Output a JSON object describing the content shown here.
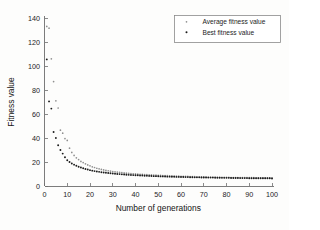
{
  "chart_data": {
    "type": "scatter",
    "title": "",
    "xlabel": "Number of generations",
    "ylabel": "Fitness value",
    "xlim": [
      0,
      100
    ],
    "ylim": [
      0,
      140
    ],
    "xticks": [
      0,
      10,
      20,
      30,
      40,
      50,
      60,
      70,
      80,
      90,
      100
    ],
    "yticks": [
      0,
      20,
      40,
      60,
      80,
      100,
      120,
      140
    ],
    "grid": false,
    "legend_position": "upper right",
    "legend": [
      "Average fitness value",
      "Best fitness value"
    ],
    "x": [
      1,
      2,
      3,
      4,
      5,
      6,
      7,
      8,
      9,
      10,
      11,
      12,
      13,
      14,
      15,
      16,
      17,
      18,
      19,
      20,
      21,
      22,
      23,
      24,
      25,
      26,
      27,
      28,
      29,
      30,
      31,
      32,
      33,
      34,
      35,
      36,
      37,
      38,
      39,
      40,
      41,
      42,
      43,
      44,
      45,
      46,
      47,
      48,
      49,
      50,
      51,
      52,
      53,
      54,
      55,
      56,
      57,
      58,
      59,
      60,
      61,
      62,
      63,
      64,
      65,
      66,
      67,
      68,
      69,
      70,
      71,
      72,
      73,
      74,
      75,
      76,
      77,
      78,
      79,
      80,
      81,
      82,
      83,
      84,
      85,
      86,
      87,
      88,
      89,
      90,
      91,
      92,
      93,
      94,
      95,
      96,
      97,
      98,
      99,
      100
    ],
    "series": [
      {
        "name": "Average fitness value",
        "marker": "dot",
        "color": "#8f8f8f",
        "values": [
          133.0,
          131.5,
          106.0,
          87.0,
          71.0,
          65.0,
          46.5,
          44.0,
          39.5,
          38.0,
          31.5,
          28.0,
          25.5,
          23.5,
          22.0,
          20.5,
          19.5,
          18.5,
          17.6,
          16.8,
          16.0,
          15.4,
          14.8,
          14.3,
          13.8,
          13.4,
          13.0,
          12.7,
          12.4,
          12.1,
          11.8,
          11.6,
          11.3,
          11.1,
          10.9,
          10.7,
          10.5,
          10.4,
          10.2,
          10.1,
          9.9,
          9.8,
          9.7,
          9.5,
          9.4,
          9.3,
          9.2,
          9.1,
          9.0,
          8.9,
          8.8,
          8.7,
          8.6,
          8.6,
          8.5,
          8.4,
          8.3,
          8.3,
          8.2,
          8.1,
          8.1,
          8.0,
          8.0,
          7.9,
          7.8,
          7.8,
          7.7,
          7.7,
          7.6,
          7.6,
          7.5,
          7.5,
          7.5,
          7.4,
          7.4,
          7.3,
          7.3,
          7.3,
          7.2,
          7.2,
          7.2,
          7.1,
          7.1,
          7.1,
          7.0,
          7.0,
          7.0,
          7.0,
          6.9,
          6.9,
          6.9,
          6.9,
          6.8,
          6.8,
          6.8,
          6.8,
          6.8,
          6.7,
          6.7,
          6.7
        ]
      },
      {
        "name": "Best fitness value",
        "marker": "dot",
        "color": "#1b1b1b",
        "values": [
          105.5,
          70.5,
          64.5,
          45.0,
          40.0,
          34.0,
          30.0,
          27.0,
          24.0,
          21.5,
          20.0,
          18.8,
          17.8,
          16.9,
          16.1,
          15.4,
          14.8,
          14.2,
          13.7,
          13.2,
          12.8,
          12.4,
          12.1,
          11.8,
          11.5,
          11.2,
          11.0,
          10.8,
          10.6,
          10.4,
          10.2,
          10.0,
          9.9,
          9.7,
          9.6,
          9.4,
          9.3,
          9.2,
          9.1,
          9.0,
          8.9,
          8.8,
          8.7,
          8.6,
          8.5,
          8.4,
          8.3,
          8.2,
          8.2,
          8.1,
          8.0,
          8.0,
          7.9,
          7.8,
          7.8,
          7.7,
          7.7,
          7.6,
          7.6,
          7.5,
          7.5,
          7.4,
          7.4,
          7.3,
          7.3,
          7.2,
          7.2,
          7.2,
          7.1,
          7.1,
          7.1,
          7.0,
          7.0,
          7.0,
          6.9,
          6.9,
          6.9,
          6.8,
          6.8,
          6.8,
          6.8,
          6.7,
          6.7,
          6.7,
          6.7,
          6.6,
          6.6,
          6.6,
          6.6,
          6.5,
          6.5,
          6.5,
          6.5,
          6.5,
          6.4,
          6.4,
          6.4,
          6.4,
          6.4,
          6.3
        ]
      }
    ]
  }
}
